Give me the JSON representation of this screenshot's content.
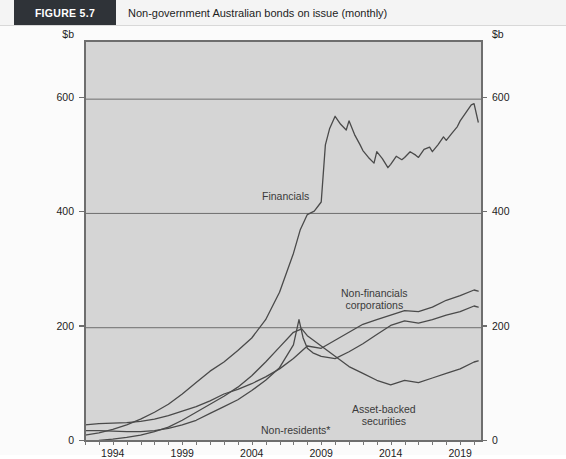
{
  "header": {
    "badge": "FIGURE 5.7",
    "title": "Non-government Australian bonds on issue (monthly)"
  },
  "chart_data": {
    "type": "line",
    "title": "Non-government Australian bonds on issue (monthly)",
    "xlabel": "",
    "ylabel": "$b",
    "y_axis_unit_left": "$b",
    "y_axis_unit_right": "$b",
    "ylim": [
      0,
      700
    ],
    "yticks": [
      0,
      200,
      400,
      600
    ],
    "ytick_labels": [
      "0",
      "200",
      "400",
      "600"
    ],
    "xlim": [
      1992,
      2020.5
    ],
    "xticks": [
      1994,
      1999,
      2004,
      2009,
      2014,
      2019
    ],
    "xtick_labels": [
      "1994",
      "1999",
      "2004",
      "2009",
      "2014",
      "2019"
    ],
    "minor_xtick_interval": 1,
    "grid": true,
    "legend": "inline-annotations",
    "footnote": "*",
    "series": [
      {
        "name": "Financials",
        "color": "#4a4a4a",
        "label_position": "inside-left-of-peak",
        "x": [
          1992,
          1993,
          1994,
          1995,
          1996,
          1997,
          1998,
          1999,
          2000,
          2001,
          2002,
          2003,
          2004,
          2005,
          2006,
          2007,
          2007.5,
          2008,
          2008.5,
          2009,
          2009.3,
          2009.6,
          2010,
          2010.4,
          2010.8,
          2011,
          2011.4,
          2011.8,
          2012,
          2012.4,
          2012.8,
          2013,
          2013.4,
          2013.8,
          2014,
          2014.4,
          2014.8,
          2015,
          2015.4,
          2015.8,
          2016,
          2016.4,
          2016.8,
          2017,
          2017.4,
          2017.8,
          2018,
          2018.4,
          2018.8,
          2019,
          2019.4,
          2019.8,
          2020,
          2020.3
        ],
        "values": [
          12,
          16,
          22,
          30,
          40,
          52,
          66,
          84,
          104,
          124,
          140,
          160,
          182,
          214,
          262,
          330,
          372,
          398,
          404,
          420,
          520,
          548,
          570,
          556,
          546,
          562,
          538,
          520,
          510,
          498,
          488,
          508,
          496,
          480,
          486,
          500,
          494,
          498,
          508,
          502,
          498,
          512,
          516,
          508,
          520,
          534,
          528,
          540,
          552,
          562,
          576,
          590,
          592,
          560
        ]
      },
      {
        "name": "Non-financials corporations",
        "color": "#4a4a4a",
        "label_position": "right-upper",
        "x": [
          1992,
          1993,
          1994,
          1995,
          1996,
          1997,
          1998,
          1999,
          2000,
          2001,
          2002,
          2003,
          2004,
          2005,
          2006,
          2007,
          2008,
          2009,
          2010,
          2011,
          2012,
          2013,
          2014,
          2015,
          2016,
          2017,
          2018,
          2019,
          2020,
          2020.3
        ],
        "values": [
          30,
          32,
          33,
          34,
          36,
          40,
          46,
          54,
          62,
          72,
          84,
          92,
          102,
          114,
          128,
          146,
          168,
          164,
          178,
          192,
          206,
          214,
          222,
          230,
          228,
          236,
          248,
          256,
          266,
          264
        ]
      },
      {
        "name": "Non-residents*",
        "color": "#4a4a4a",
        "label_position": "bottom-centre",
        "x": [
          1992,
          1993,
          1994,
          1995,
          1996,
          1997,
          1998,
          1999,
          2000,
          2001,
          2002,
          2003,
          2004,
          2005,
          2006,
          2007,
          2007.4,
          2007.7,
          2008,
          2008.4,
          2009,
          2010,
          2011,
          2012,
          2013,
          2014,
          2015,
          2016,
          2017,
          2018,
          2019,
          2020,
          2020.3
        ],
        "values": [
          20,
          20,
          19,
          18,
          18,
          20,
          24,
          30,
          38,
          50,
          62,
          74,
          90,
          108,
          130,
          170,
          214,
          182,
          164,
          156,
          150,
          146,
          158,
          172,
          188,
          204,
          212,
          208,
          214,
          222,
          228,
          238,
          236
        ]
      },
      {
        "name": "Asset-backed securities",
        "color": "#4a4a4a",
        "label_position": "bottom-right",
        "x": [
          1992,
          1993,
          1994,
          1995,
          1996,
          1997,
          1998,
          1999,
          2000,
          2001,
          2002,
          2003,
          2004,
          2005,
          2006,
          2007,
          2007.6,
          2008,
          2009,
          2010,
          2011,
          2012,
          2013,
          2014,
          2015,
          2016,
          2017,
          2018,
          2019,
          2020,
          2020.3
        ],
        "values": [
          2,
          3,
          5,
          8,
          12,
          18,
          26,
          38,
          52,
          66,
          80,
          96,
          116,
          140,
          166,
          192,
          198,
          186,
          168,
          150,
          132,
          120,
          108,
          100,
          108,
          104,
          112,
          120,
          128,
          140,
          142
        ]
      }
    ],
    "annotations": [
      {
        "text": "Financials",
        "series": "Financials"
      },
      {
        "text": "Non-financials",
        "series": "Non-financials corporations"
      },
      {
        "text": "corporations",
        "series": "Non-financials corporations"
      },
      {
        "text": "Asset-backed",
        "series": "Asset-backed securities"
      },
      {
        "text": "securities",
        "series": "Asset-backed securities"
      },
      {
        "text": "Non-residents*",
        "series": "Non-residents*"
      }
    ]
  },
  "labels": {
    "financials": "Financials",
    "nonfin_line1": "Non-financials",
    "nonfin_line2": "corporations",
    "assetbacked_line1": "Asset-backed",
    "assetbacked_line2": "securities",
    "nonresidents": "Non-residents*"
  },
  "colors": {
    "plot_background": "#d5d5d5",
    "page_background": "#fbfbfb",
    "line": "#4a4a4a",
    "grid": "#6e6e6e",
    "badge_background": "#2f3338",
    "text": "#1d1d1d"
  }
}
